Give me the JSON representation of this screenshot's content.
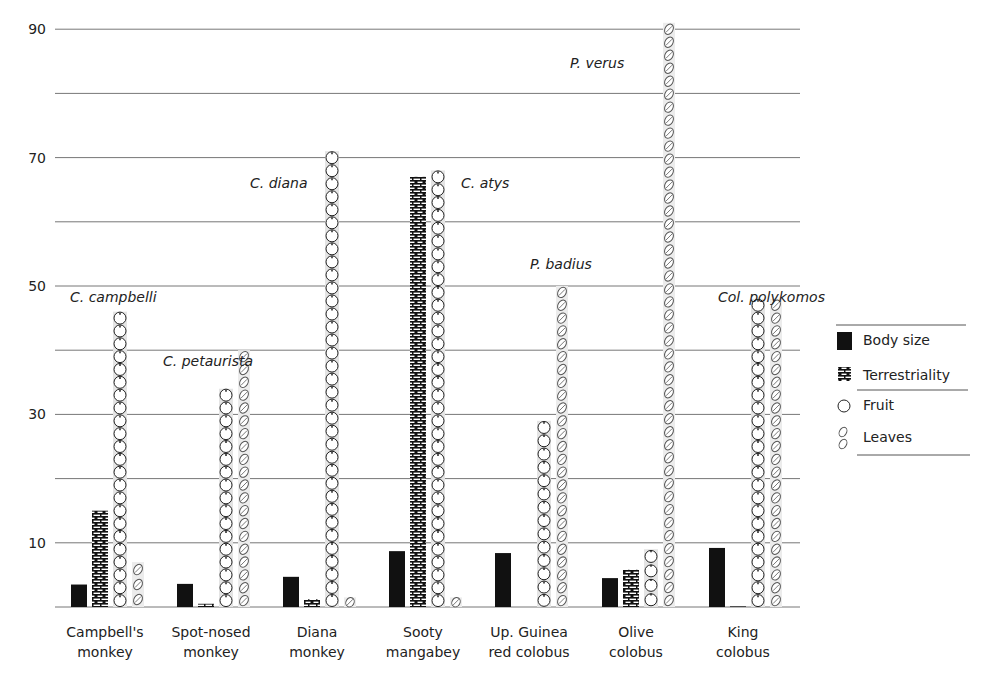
{
  "chart_data": {
    "type": "bar",
    "title": "",
    "xlabel": "",
    "ylabel": "",
    "ylim": [
      0,
      90
    ],
    "yticks": [
      10,
      30,
      50,
      70,
      90
    ],
    "gridlines": [
      10,
      20,
      30,
      40,
      50,
      60,
      70,
      80,
      90
    ],
    "grid": true,
    "legend_position": "right",
    "categories": [
      "Campbell's monkey",
      "Spot-nosed monkey",
      "Diana monkey",
      "Sooty mangabey",
      "Up. Guinea red colobus",
      "Olive colobus",
      "King colobus"
    ],
    "category_lines": [
      [
        "Campbell's",
        "monkey"
      ],
      [
        "Spot-nosed",
        "monkey"
      ],
      [
        "Diana",
        "monkey"
      ],
      [
        "Sooty",
        "mangabey"
      ],
      [
        "Up. Guinea",
        "red colobus"
      ],
      [
        "Olive",
        "colobus"
      ],
      [
        "King",
        "colobus"
      ]
    ],
    "species_labels": [
      "C. campbelli",
      "C. petaurista",
      "C. diana",
      "C. atys",
      "P. badius",
      "P. verus",
      "Col. polykomos"
    ],
    "series": [
      {
        "name": "Body size",
        "pattern": "solid",
        "values": [
          3.5,
          3.6,
          4.7,
          8.7,
          8.4,
          4.5,
          9.2
        ]
      },
      {
        "name": "Terrestriality",
        "pattern": "brick",
        "values": [
          15,
          0.5,
          1.2,
          67,
          0,
          5.8,
          0.1
        ]
      },
      {
        "name": "Fruit",
        "pattern": "fruit",
        "values": [
          46,
          34,
          71,
          68,
          29,
          9,
          48
        ]
      },
      {
        "name": "Leaves",
        "pattern": "leaf",
        "values": [
          7,
          40,
          1.5,
          1.5,
          50,
          91,
          48
        ]
      }
    ]
  },
  "legend": {
    "items": [
      {
        "label": "Body size",
        "icon": "solid-square-icon"
      },
      {
        "label": "Terrestriality",
        "icon": "brick-icon"
      },
      {
        "label": "Fruit",
        "icon": "fruit-icon"
      },
      {
        "label": "Leaves",
        "icon": "leaf-icon"
      }
    ]
  }
}
